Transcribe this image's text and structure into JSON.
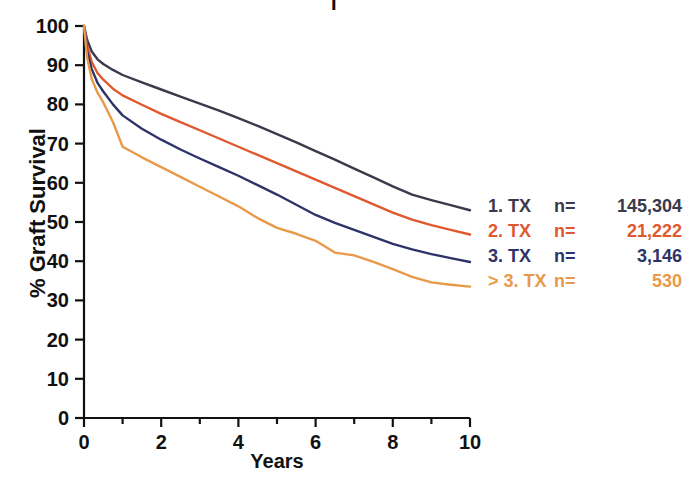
{
  "title_fragment": "I",
  "axes": {
    "ylabel": "% Graft Survival",
    "xlabel": "Years",
    "yticks": [
      "0",
      "10",
      "20",
      "30",
      "40",
      "50",
      "60",
      "70",
      "80",
      "90",
      "100"
    ],
    "xticks": [
      "0",
      "2",
      "4",
      "6",
      "8",
      "10"
    ]
  },
  "legend": {
    "rows": [
      {
        "label": "1. TX",
        "eq": "n=",
        "n": "145,304",
        "color": "#3a3a4a"
      },
      {
        "label": "2. TX",
        "eq": "n=",
        "n": "21,222",
        "color": "#e0582f"
      },
      {
        "label": "3. TX",
        "eq": "n=",
        "n": "3,146",
        "color": "#2e3468"
      },
      {
        "label": "> 3. TX",
        "eq": "n=",
        "n": "530",
        "color": "#e89a4a"
      }
    ]
  },
  "chart_data": {
    "type": "line",
    "title": "",
    "xlabel": "Years",
    "ylabel": "% Graft Survival",
    "xlim": [
      0,
      10
    ],
    "ylim": [
      0,
      100
    ],
    "xticks": [
      0,
      1,
      2,
      3,
      4,
      5,
      6,
      7,
      8,
      9,
      10
    ],
    "xticklabels": [
      "0",
      "",
      "2",
      "",
      "4",
      "",
      "6",
      "",
      "8",
      "",
      "10"
    ],
    "yticks": [
      0,
      10,
      20,
      30,
      40,
      50,
      60,
      70,
      80,
      90,
      100
    ],
    "grid": false,
    "legend_position": "right",
    "x": [
      0,
      0.08,
      0.2,
      0.35,
      0.5,
      0.75,
      1,
      1.5,
      2,
      2.5,
      3,
      3.5,
      4,
      4.5,
      5,
      5.5,
      6,
      6.5,
      7,
      7.5,
      8,
      8.5,
      9,
      9.5,
      10
    ],
    "series": [
      {
        "name": "1. TX",
        "n": 145304,
        "color": "#3a3a4a",
        "values": [
          100,
          96.5,
          93.5,
          91.5,
          90.3,
          88.8,
          87.5,
          85.6,
          83.8,
          82.0,
          80.2,
          78.4,
          76.5,
          74.5,
          72.4,
          70.3,
          68.1,
          65.9,
          63.6,
          61.4,
          59.1,
          57.0,
          55.6,
          54.3,
          53.0
        ]
      },
      {
        "name": "2. TX",
        "n": 21222,
        "color": "#e0582f",
        "values": [
          100,
          95.0,
          90.8,
          88.0,
          86.3,
          84.0,
          82.3,
          79.9,
          77.6,
          75.5,
          73.4,
          71.3,
          69.2,
          67.1,
          65.0,
          62.9,
          60.8,
          58.7,
          56.6,
          54.5,
          52.4,
          50.6,
          49.2,
          48.0,
          46.8
        ]
      },
      {
        "name": "3. TX",
        "n": 3146,
        "color": "#2e3468",
        "values": [
          100,
          93.5,
          89.0,
          85.5,
          83.3,
          80.0,
          77.2,
          73.8,
          71.0,
          68.5,
          66.2,
          64.0,
          61.8,
          59.4,
          57.0,
          54.4,
          51.8,
          49.8,
          48.0,
          46.2,
          44.4,
          43.0,
          41.8,
          40.8,
          39.8
        ]
      },
      {
        "name": "> 3. TX",
        "n": 530,
        "color": "#e89a4a",
        "values": [
          100,
          92.0,
          86.5,
          83.0,
          80.5,
          75.5,
          69.2,
          66.5,
          64.0,
          61.5,
          59.0,
          56.5,
          54.0,
          51.0,
          48.5,
          47.0,
          45.2,
          42.2,
          41.5,
          39.8,
          38.0,
          36.0,
          34.6,
          34.0,
          33.5
        ]
      }
    ]
  },
  "geometry": {
    "x0_px": 84,
    "x1_px": 470,
    "y0_px": 418,
    "y1_px": 26
  }
}
